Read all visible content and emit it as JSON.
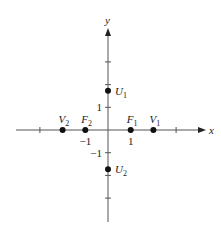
{
  "diagram": {
    "type": "coordinate-plane-points",
    "axes": {
      "x_label": "x",
      "y_label": "y",
      "x_ticks": [
        -3,
        -2,
        -1,
        1,
        2,
        3
      ],
      "y_ticks": [
        -3,
        -2,
        -1,
        1,
        2,
        3
      ],
      "x_tick_labels": [
        {
          "value": -1,
          "text": "−1"
        },
        {
          "value": 1,
          "text": "1"
        }
      ],
      "y_tick_labels": [
        {
          "value": 1,
          "text": "1"
        },
        {
          "value": -1,
          "text": "−1"
        }
      ]
    },
    "points": [
      {
        "id": "V2",
        "name": "V",
        "sub": "2",
        "x": -2,
        "y": 0,
        "label_pos": "above"
      },
      {
        "id": "F2",
        "name": "F",
        "sub": "2",
        "x": -1,
        "y": 0,
        "label_pos": "above"
      },
      {
        "id": "F1",
        "name": "F",
        "sub": "1",
        "x": 1,
        "y": 0,
        "label_pos": "above"
      },
      {
        "id": "V1",
        "name": "V",
        "sub": "1",
        "x": 2,
        "y": 0,
        "label_pos": "above"
      },
      {
        "id": "U1",
        "name": "U",
        "sub": "1",
        "x": 0,
        "y": 1.73,
        "label_pos": "right"
      },
      {
        "id": "U2",
        "name": "U",
        "sub": "2",
        "x": 0,
        "y": -1.73,
        "label_pos": "right"
      }
    ],
    "colors": {
      "axis": "#555555",
      "point": "#111111",
      "text": "#222222"
    }
  }
}
